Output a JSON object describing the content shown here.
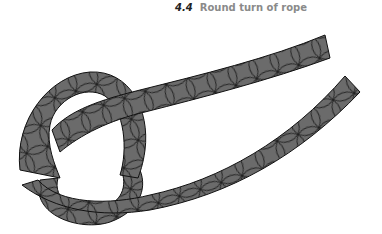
{
  "figure": {
    "number": "4.4",
    "title": "Round turn of rope",
    "illustration": "rope-round-turn",
    "colors": {
      "rope_fill": "#6b6b6b",
      "rope_stroke": "#111111",
      "caption_number": "#222222",
      "caption_text": "#8a8a8a"
    }
  }
}
